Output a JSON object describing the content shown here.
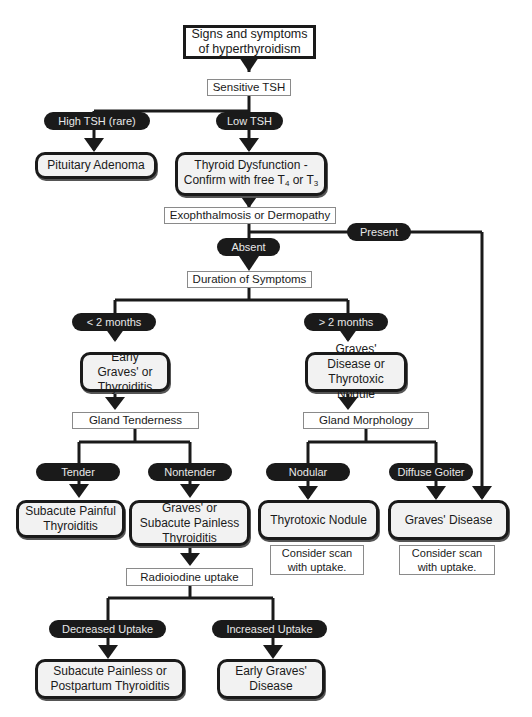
{
  "diagram": {
    "start": "Signs and symptoms of hyperthyroidism",
    "tests": {
      "tsh": "Sensitive TSH",
      "eye_skin": "Exophthalmosis or Dermopathy",
      "duration": "Duration of Symptoms",
      "tenderness": "Gland Tenderness",
      "morphology": "Gland Morphology",
      "radioiodine": "Radioiodine uptake"
    },
    "branches": {
      "high_tsh": "High TSH (rare)",
      "low_tsh": "Low TSH",
      "present": "Present",
      "absent": "Absent",
      "lt2": "< 2 months",
      "gt2": "> 2 months",
      "tender": "Tender",
      "nontender": "Nontender",
      "nodular": "Nodular",
      "diffuse": "Diffuse Goiter",
      "decreased": "Decreased Uptake",
      "increased": "Increased Uptake"
    },
    "outcomes": {
      "pituitary": "Pituitary Adenoma",
      "dysfunction_l1": "Thyroid Dysfunction -",
      "dysfunction_l2_pre": "Confirm with free T",
      "dysfunction_sub1": "4",
      "dysfunction_mid": " or T",
      "dysfunction_sub2": "3",
      "early_graves_thyroiditis": "Early Graves' or Thyroiditis",
      "graves_or_nodule": "Graves' Disease or Thyrotoxic Nodule",
      "subacute_painful": "Subacute Painful Thyroiditis",
      "graves_or_painless": "Graves' or Subacute Painless Thyroiditis",
      "thyrotoxic_nodule": "Thyrotoxic Nodule",
      "graves_disease": "Graves' Disease",
      "painless_postpartum": "Subacute Painless or Postpartum Thyroiditis",
      "early_graves_disease": "Early Graves' Disease"
    },
    "notes": {
      "nodule_scan": "Consider scan with uptake.",
      "graves_scan": "Consider scan with uptake."
    }
  }
}
